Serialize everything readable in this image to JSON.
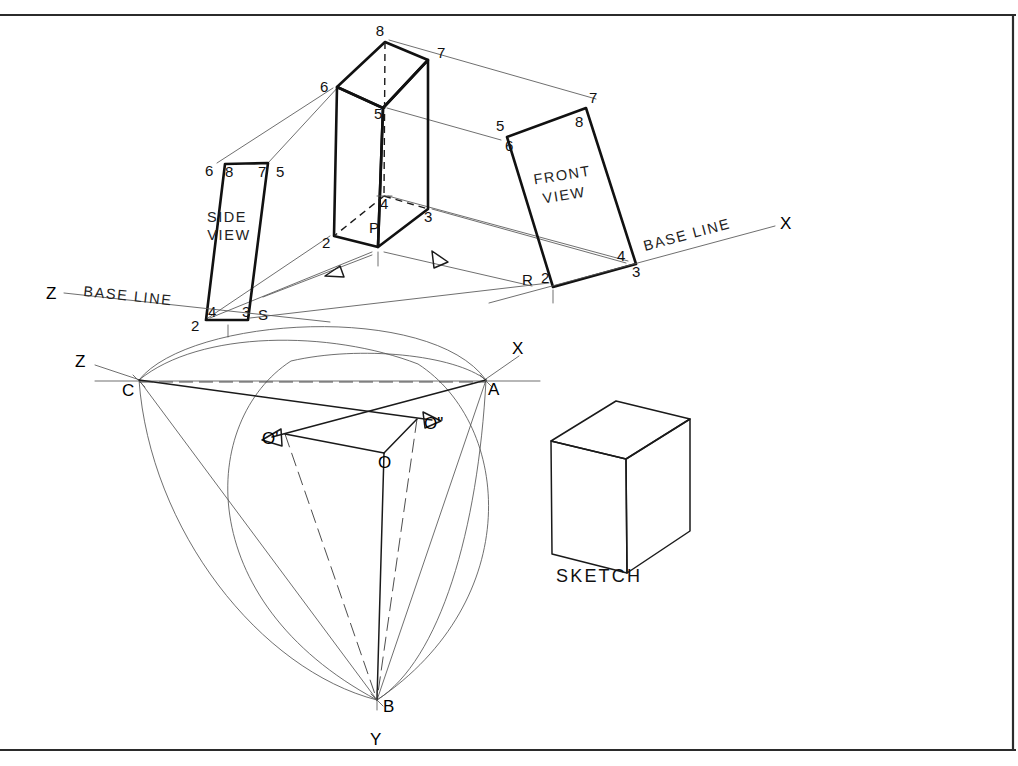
{
  "sheet": {
    "width": 1018,
    "height": 766,
    "background": "#ffffff",
    "ink_color": "#111111",
    "thin_ink_color": "#555555",
    "border": {
      "top": true,
      "bottom": true,
      "right": true,
      "left": false
    }
  },
  "title_blocks": {
    "side_view_label_line1": "SIDE",
    "side_view_label_line2": "VIEW",
    "front_view_label_line1": "FRONT",
    "front_view_label_line2": "VIEW",
    "sketch_label": "SKETCH",
    "base_line_left": "BASE  LINE",
    "base_line_right": "BASE  LINE"
  },
  "axes": {
    "upper_z": "Z",
    "upper_x": "X",
    "lower_z": "Z",
    "lower_x": "X",
    "lower_y": "Y"
  },
  "prism_vertices": [
    {
      "name": "8",
      "label": "8",
      "x": 385,
      "y": 40
    },
    {
      "name": "7",
      "label": "7",
      "x": 430,
      "y": 57
    },
    {
      "name": "6",
      "label": "6",
      "x": 336,
      "y": 88
    },
    {
      "name": "5",
      "label": "5",
      "x": 383,
      "y": 108
    },
    {
      "name": "4",
      "label": "4",
      "x": 385,
      "y": 197
    },
    {
      "name": "3",
      "label": "3",
      "x": 428,
      "y": 209
    },
    {
      "name": "2",
      "label": "2",
      "x": 333,
      "y": 235
    },
    {
      "name": "P",
      "label": "P",
      "x": 379,
      "y": 247
    }
  ],
  "side_view_vertices": [
    {
      "label": "8",
      "x": 230,
      "y": 174
    },
    {
      "label": "7",
      "x": 263,
      "y": 174
    },
    {
      "label": "6",
      "x": 212,
      "y": 174
    },
    {
      "label": "5",
      "x": 281,
      "y": 174
    },
    {
      "label": "4",
      "x": 213,
      "y": 314
    },
    {
      "label": "3",
      "x": 247,
      "y": 314
    },
    {
      "label": "2",
      "x": 196,
      "y": 328
    },
    {
      "label": "S",
      "x": 263,
      "y": 317
    }
  ],
  "front_view_vertices": [
    {
      "label": "7",
      "x": 593,
      "y": 100
    },
    {
      "label": "8",
      "x": 580,
      "y": 124
    },
    {
      "label": "5",
      "x": 500,
      "y": 128
    },
    {
      "label": "6",
      "x": 510,
      "y": 147
    },
    {
      "label": "4",
      "x": 623,
      "y": 258
    },
    {
      "label": "3",
      "x": 638,
      "y": 272
    },
    {
      "label": "2",
      "x": 546,
      "y": 280
    },
    {
      "label": "R",
      "x": 529,
      "y": 282
    }
  ],
  "construction_points": [
    {
      "label": "Z",
      "x": 81,
      "y": 362
    },
    {
      "label": "C",
      "x": 128,
      "y": 392
    },
    {
      "label": "X",
      "x": 518,
      "y": 349
    },
    {
      "label": "A",
      "x": 493,
      "y": 390
    },
    {
      "label": "O'",
      "x": 272,
      "y": 440
    },
    {
      "label": "O\"",
      "x": 430,
      "y": 425
    },
    {
      "label": "O",
      "x": 385,
      "y": 462
    },
    {
      "label": "B",
      "x": 385,
      "y": 707
    },
    {
      "label": "Y",
      "x": 377,
      "y": 740
    }
  ],
  "geometry": {
    "prism": {
      "v8": [
        385,
        42
      ],
      "v7": [
        428,
        60
      ],
      "v6": [
        337,
        87
      ],
      "v5": [
        383,
        108
      ],
      "v4": [
        384,
        196
      ],
      "v3": [
        428,
        209
      ],
      "v2": [
        334,
        236
      ],
      "vP": [
        378,
        247
      ]
    },
    "side_view_quad": [
      [
        225,
        164
      ],
      [
        268,
        163
      ],
      [
        248,
        320
      ],
      [
        206,
        320
      ]
    ],
    "front_view_quad": [
      [
        507,
        137
      ],
      [
        586,
        108
      ],
      [
        636,
        264
      ],
      [
        553,
        287
      ]
    ],
    "sketch_box": {
      "front": [
        [
          551,
          440
        ],
        [
          551,
          553
        ],
        [
          626,
          572
        ],
        [
          626,
          460
        ]
      ],
      "top": [
        [
          551,
          440
        ],
        [
          616,
          401
        ],
        [
          690,
          419
        ],
        [
          626,
          460
        ]
      ],
      "side": [
        [
          626,
          460
        ],
        [
          690,
          419
        ],
        [
          690,
          530
        ],
        [
          626,
          572
        ]
      ]
    },
    "lower_triangle": {
      "C": [
        139,
        380
      ],
      "A": [
        486,
        380
      ],
      "B": [
        377,
        700
      ],
      "O": [
        384,
        453
      ],
      "Oprime": [
        285,
        434
      ],
      "Odblprime": [
        417,
        419
      ]
    }
  },
  "counts": {
    "vertex_labels": 8,
    "views": 3,
    "axis_labels": 5
  }
}
